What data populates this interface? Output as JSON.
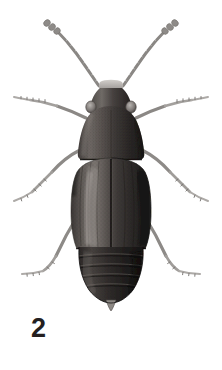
{
  "plate": {
    "figure_number": "2",
    "background_color": "#ffffff",
    "width": 222,
    "height": 370,
    "medium": "halftone-engraving",
    "view": "dorsal"
  },
  "specimen": {
    "name": "beetle-dorsal-habitus",
    "body_color_dark": "#201d1d",
    "body_color_mid": "#4a4646",
    "body_color_light": "#8d8a88",
    "appendage_color": "#9a9896",
    "highlight_color": "#c9c6c3",
    "parts": [
      {
        "id": "antenna-left",
        "label": "Left antenna"
      },
      {
        "id": "antenna-right",
        "label": "Right antenna"
      },
      {
        "id": "head",
        "label": "Head"
      },
      {
        "id": "eye-left",
        "label": "Left compound eye"
      },
      {
        "id": "eye-right",
        "label": "Right compound eye"
      },
      {
        "id": "pronotum",
        "label": "Pronotum"
      },
      {
        "id": "elytra",
        "label": "Elytra"
      },
      {
        "id": "elytral-suture",
        "label": "Elytral suture"
      },
      {
        "id": "abdomen",
        "label": "Abdomen"
      },
      {
        "id": "pygidium",
        "label": "Pygidium"
      },
      {
        "id": "foreleg-left",
        "label": "Left foreleg"
      },
      {
        "id": "foreleg-right",
        "label": "Right foreleg"
      },
      {
        "id": "midleg-left",
        "label": "Left midleg"
      },
      {
        "id": "midleg-right",
        "label": "Right midleg"
      },
      {
        "id": "hindleg-left",
        "label": "Left hindleg"
      },
      {
        "id": "hindleg-right",
        "label": "Right hindleg"
      }
    ]
  }
}
